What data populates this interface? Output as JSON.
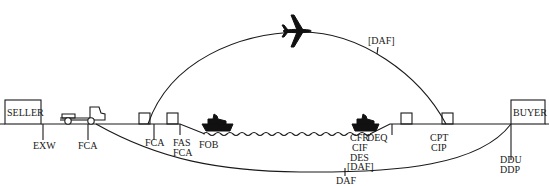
{
  "parties": {
    "seller": "SELLER",
    "buyer": "BUYER"
  },
  "labels": {
    "exw": "EXW",
    "fca_truck": "FCA",
    "fca_terminal": "FCA",
    "fas": "FAS",
    "fca_port": "FCA",
    "fob": "FOB",
    "cfr": "CFR",
    "cif": "CIF",
    "des": "DES",
    "daf_bracket_sea": "[DAF]",
    "deq": "DEQ",
    "cpt": "CPT",
    "cip": "CIP",
    "ddu": "DDU",
    "ddp": "DDP",
    "daf_land": "DAF",
    "daf_bracket_air": "[DAF]"
  },
  "icons": {
    "truck": "truck-icon",
    "ship_origin": "ship-icon",
    "ship_destination": "ship-icon",
    "airplane": "airplane-icon",
    "waves": "sea-waves-icon",
    "warehouses": "warehouse-box-icon"
  },
  "colors": {
    "ink": "#1a1a1a",
    "background": "#ffffff"
  }
}
